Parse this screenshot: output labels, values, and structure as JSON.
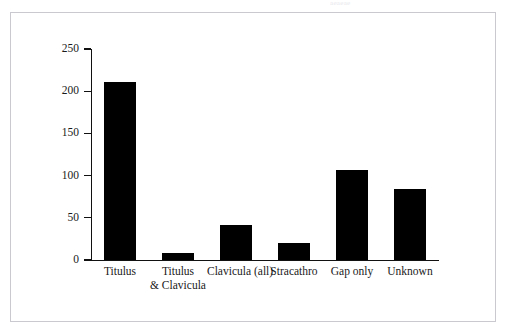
{
  "page": {
    "top_sliver_text": "aeaeae"
  },
  "chart_data": {
    "type": "bar",
    "title": "",
    "subtitle": "",
    "xlabel": "",
    "ylabel": "",
    "categories": [
      "Titulus",
      "Titulus & Clavicula",
      "Clavicula (all)",
      "Stracathro",
      "Gap only",
      "Unknown"
    ],
    "category_lines": [
      [
        "Titulus"
      ],
      [
        "Titulus",
        "& Clavicula"
      ],
      [
        "Clavicula (all)"
      ],
      [
        "Stracathro"
      ],
      [
        "Gap only"
      ],
      [
        "Unknown"
      ]
    ],
    "values": [
      211,
      8,
      41,
      20,
      107,
      84
    ],
    "ylim": [
      0,
      250
    ],
    "yticks": [
      0,
      50,
      100,
      150,
      200,
      250
    ],
    "ytick_labels": [
      "0",
      "50",
      "100",
      "150",
      "200",
      "250"
    ],
    "grid": false,
    "legend": false,
    "legend_position": "none",
    "bar_color": "#000000",
    "axis_color": "#111111",
    "frame_color": "#c9c9cf",
    "background_color": "#ffffff"
  }
}
